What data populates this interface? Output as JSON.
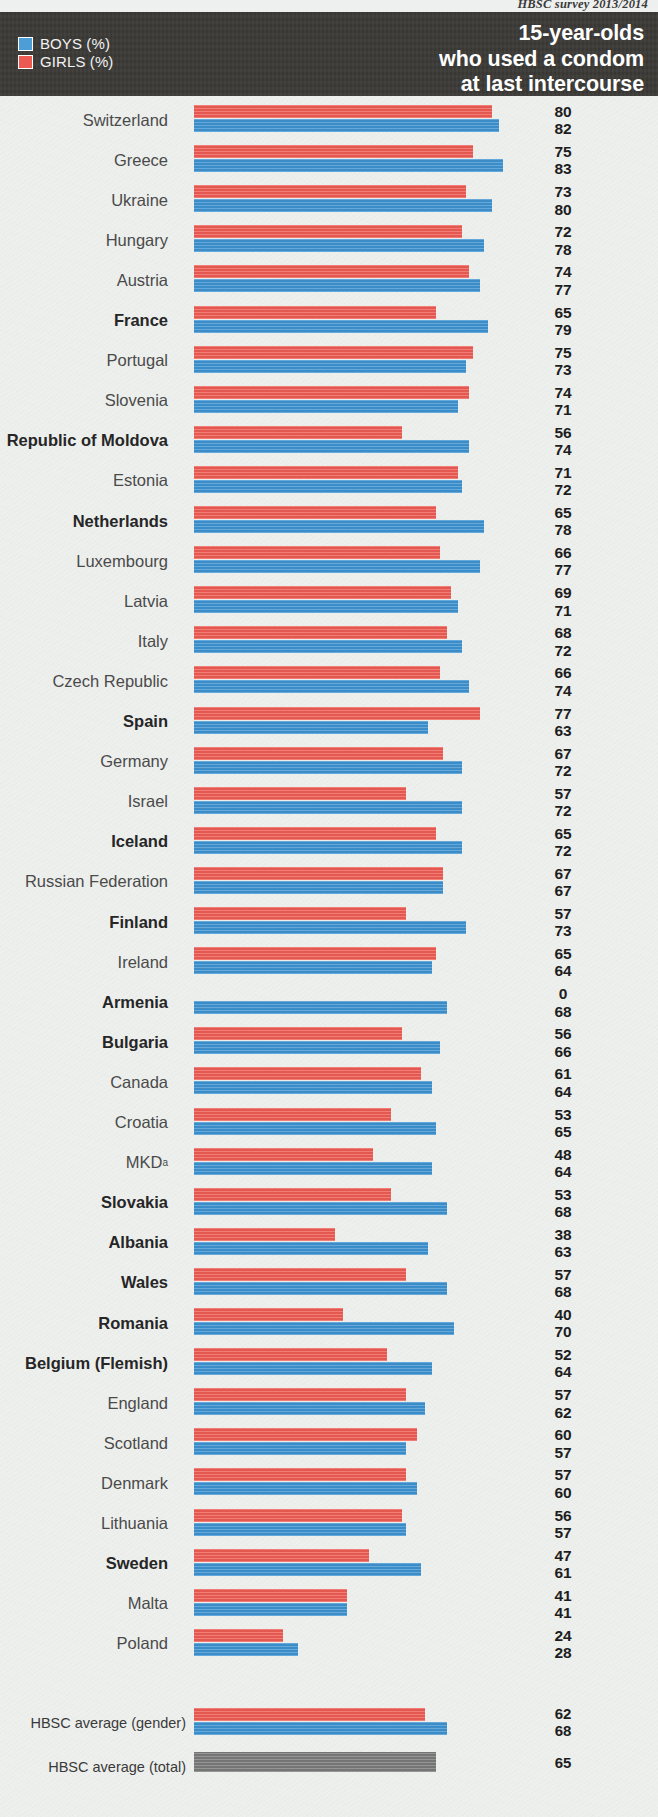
{
  "source": "HBSC survey 2013/2014",
  "header": {
    "title_lines": [
      "15-year-olds",
      "who used a condom",
      "at last intercourse"
    ],
    "legend": [
      {
        "key": "boys",
        "label": "BOYS (%)",
        "color": "#4d9ed6"
      },
      {
        "key": "girls",
        "label": "GIRLS (%)",
        "color": "#ec5a52"
      }
    ]
  },
  "chart_data": {
    "type": "bar",
    "orientation": "horizontal",
    "title": "15-year-olds who used a condom at last intercourse",
    "subtitle": "HBSC survey 2013/2014",
    "xlabel": "",
    "ylabel": "",
    "xlim": [
      0,
      100
    ],
    "grid": false,
    "legend_position": "top-left",
    "value_suffix": "%",
    "categories": [
      "Switzerland",
      "Greece",
      "Ukraine",
      "Hungary",
      "Austria",
      "France",
      "Portugal",
      "Slovenia",
      "Republic of Moldova",
      "Estonia",
      "Netherlands",
      "Luxembourg",
      "Latvia",
      "Italy",
      "Czech Republic",
      "Spain",
      "Germany",
      "Israel",
      "Iceland",
      "Russian Federation",
      "Finland",
      "Ireland",
      "Armenia",
      "Bulgaria",
      "Canada",
      "Croatia",
      "MKD",
      "Slovakia",
      "Albania",
      "Wales",
      "Romania",
      "Belgium (Flemish)",
      "England",
      "Scotland",
      "Denmark",
      "Lithuania",
      "Sweden",
      "Malta",
      "Poland"
    ],
    "series": [
      {
        "name": "GIRLS (%)",
        "color": "#ef5d54",
        "values": [
          80,
          75,
          73,
          72,
          74,
          65,
          75,
          74,
          56,
          71,
          65,
          66,
          69,
          68,
          66,
          77,
          67,
          57,
          65,
          67,
          57,
          65,
          0,
          56,
          61,
          53,
          48,
          53,
          38,
          57,
          40,
          52,
          57,
          60,
          57,
          56,
          47,
          41,
          24
        ]
      },
      {
        "name": "BOYS (%)",
        "color": "#3f93d2",
        "values": [
          82,
          83,
          80,
          78,
          77,
          79,
          73,
          71,
          74,
          72,
          78,
          77,
          71,
          72,
          74,
          63,
          72,
          72,
          72,
          67,
          73,
          64,
          68,
          66,
          64,
          65,
          64,
          68,
          63,
          68,
          70,
          64,
          62,
          57,
          60,
          57,
          61,
          41,
          28
        ]
      }
    ],
    "averages": [
      {
        "label": "HBSC average (gender)",
        "girls": 62,
        "boys": 68
      },
      {
        "label": "HBSC average (total)",
        "total": 65,
        "color": "#7b7b7b"
      }
    ]
  },
  "rows": [
    {
      "label": "Switzerland",
      "bold": false,
      "girls": 80,
      "boys": 82
    },
    {
      "label": "Greece",
      "bold": false,
      "girls": 75,
      "boys": 83
    },
    {
      "label": "Ukraine",
      "bold": false,
      "girls": 73,
      "boys": 80
    },
    {
      "label": "Hungary",
      "bold": false,
      "girls": 72,
      "boys": 78
    },
    {
      "label": "Austria",
      "bold": false,
      "girls": 74,
      "boys": 77
    },
    {
      "label": "France",
      "bold": true,
      "girls": 65,
      "boys": 79
    },
    {
      "label": "Portugal",
      "bold": false,
      "girls": 75,
      "boys": 73
    },
    {
      "label": "Slovenia",
      "bold": false,
      "girls": 74,
      "boys": 71
    },
    {
      "label": "Republic of Moldova",
      "bold": true,
      "girls": 56,
      "boys": 74
    },
    {
      "label": "Estonia",
      "bold": false,
      "girls": 71,
      "boys": 72
    },
    {
      "label": "Netherlands",
      "bold": true,
      "girls": 65,
      "boys": 78
    },
    {
      "label": "Luxembourg",
      "bold": false,
      "girls": 66,
      "boys": 77
    },
    {
      "label": "Latvia",
      "bold": false,
      "girls": 69,
      "boys": 71
    },
    {
      "label": "Italy",
      "bold": false,
      "girls": 68,
      "boys": 72
    },
    {
      "label": "Czech Republic",
      "bold": false,
      "girls": 66,
      "boys": 74
    },
    {
      "label": "Spain",
      "bold": true,
      "girls": 77,
      "boys": 63
    },
    {
      "label": "Germany",
      "bold": false,
      "girls": 67,
      "boys": 72
    },
    {
      "label": "Israel",
      "bold": false,
      "girls": 57,
      "boys": 72
    },
    {
      "label": "Iceland",
      "bold": true,
      "girls": 65,
      "boys": 72
    },
    {
      "label": "Russian Federation",
      "bold": false,
      "girls": 67,
      "boys": 67
    },
    {
      "label": "Finland",
      "bold": true,
      "girls": 57,
      "boys": 73
    },
    {
      "label": "Ireland",
      "bold": false,
      "girls": 65,
      "boys": 64
    },
    {
      "label": "Armenia",
      "bold": true,
      "girls": 0,
      "boys": 68
    },
    {
      "label": "Bulgaria",
      "bold": true,
      "girls": 56,
      "boys": 66
    },
    {
      "label": "Canada",
      "bold": false,
      "girls": 61,
      "boys": 64
    },
    {
      "label": "Croatia",
      "bold": false,
      "girls": 53,
      "boys": 65
    },
    {
      "label": "MKD",
      "bold": false,
      "sup": "a",
      "girls": 48,
      "boys": 64
    },
    {
      "label": "Slovakia",
      "bold": true,
      "girls": 53,
      "boys": 68
    },
    {
      "label": "Albania",
      "bold": true,
      "girls": 38,
      "boys": 63
    },
    {
      "label": "Wales",
      "bold": true,
      "girls": 57,
      "boys": 68
    },
    {
      "label": "Romania",
      "bold": true,
      "girls": 40,
      "boys": 70
    },
    {
      "label": "Belgium (Flemish)",
      "bold": true,
      "girls": 52,
      "boys": 64
    },
    {
      "label": "England",
      "bold": false,
      "girls": 57,
      "boys": 62
    },
    {
      "label": "Scotland",
      "bold": false,
      "girls": 60,
      "boys": 57
    },
    {
      "label": "Denmark",
      "bold": false,
      "girls": 57,
      "boys": 60
    },
    {
      "label": "Lithuania",
      "bold": false,
      "girls": 56,
      "boys": 57
    },
    {
      "label": "Sweden",
      "bold": true,
      "girls": 47,
      "boys": 61
    },
    {
      "label": "Malta",
      "bold": false,
      "girls": 41,
      "boys": 41
    },
    {
      "label": "Poland",
      "bold": false,
      "girls": 24,
      "boys": 28
    }
  ],
  "averages": [
    {
      "label": "HBSC average (gender)",
      "girls": 62,
      "boys": 68
    },
    {
      "label": "HBSC average (total)",
      "total": 65
    }
  ]
}
